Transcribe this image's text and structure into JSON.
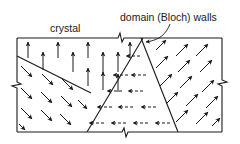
{
  "labels": {
    "crystal": "crystal",
    "walls": "domain (Bloch) walls"
  },
  "colors": {
    "ink": "#1a1a1a",
    "background": "#ffffff"
  },
  "crystal_box": {
    "x": 17,
    "y": 38,
    "width": 205,
    "height": 94
  },
  "domains": [
    {
      "name": "top-left",
      "arrow_direction": "up"
    },
    {
      "name": "bottom-left",
      "arrow_direction": "down-right"
    },
    {
      "name": "center",
      "arrow_direction": "left"
    },
    {
      "name": "right",
      "arrow_direction": "up-right"
    }
  ],
  "walls": [
    {
      "name": "wall-1",
      "from": [
        17,
        56
      ],
      "to": [
        91,
        93
      ]
    },
    {
      "name": "wall-2",
      "from": [
        143,
        38
      ],
      "to": [
        87,
        132
      ]
    },
    {
      "name": "wall-3",
      "from": [
        141,
        38
      ],
      "to": [
        178,
        132
      ]
    }
  ],
  "icons": {
    "break_mark": "zigzag-break-icon",
    "arrow": "magnetization-arrow-icon"
  }
}
